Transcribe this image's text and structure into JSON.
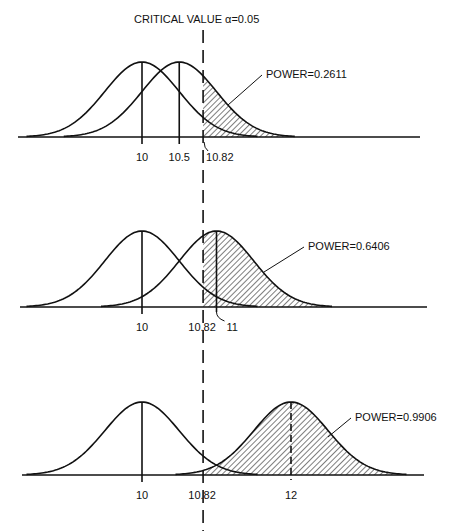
{
  "chart_data": {
    "type": "area",
    "title": "CRITICAL VALUE α=0.05",
    "critical_value": 10.82,
    "alpha": 0.05,
    "sigma": 0.5,
    "null_mean": 10,
    "xlabel": "",
    "ylabel": "",
    "grid": false,
    "panels": [
      {
        "alt_mean": 10.5,
        "power": 0.2611,
        "power_label": "POWER=0.2611",
        "tick_labels": [
          "10",
          "10.5",
          "10.82"
        ]
      },
      {
        "alt_mean": 11,
        "power": 0.6406,
        "power_label": "POWER=0.6406",
        "tick_labels": [
          "10",
          "10.82",
          "11"
        ]
      },
      {
        "alt_mean": 12,
        "power": 0.9906,
        "power_label": "POWER=0.9906",
        "tick_labels": [
          "10",
          "10.82",
          "12"
        ]
      }
    ]
  },
  "colors": {
    "ink": "#111111",
    "background": "#ffffff"
  }
}
